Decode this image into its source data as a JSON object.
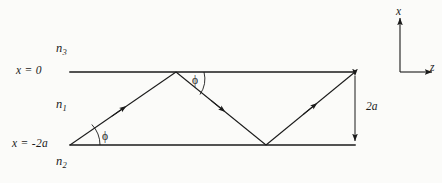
{
  "figure": {
    "background_color": "#fbfbf9",
    "ink_color": "#1a1a1a"
  },
  "boundaries": {
    "top": {
      "label_x": "x",
      "label_eq": "=",
      "label_value": "0",
      "label_full": "x = 0",
      "y_px": 72,
      "x_start_px": 70,
      "x_end_px": 355
    },
    "bottom": {
      "label_x": "x",
      "label_eq": "=",
      "label_value": "-2a",
      "label_full": "x = -2a",
      "y_px": 145,
      "x_start_px": 70,
      "x_end_px": 355
    }
  },
  "media": [
    {
      "name": "n",
      "subscript": "3",
      "region": "above-top-boundary",
      "x_px": 56,
      "y_px": 48
    },
    {
      "name": "n",
      "subscript": "1",
      "region": "core-between-boundaries",
      "x_px": 56,
      "y_px": 104
    },
    {
      "name": "n",
      "subscript": "2",
      "region": "below-bottom-boundary",
      "x_px": 56,
      "y_px": 160
    }
  ],
  "ray": {
    "vertices": [
      {
        "x": 70,
        "y": 145,
        "kind": "launch-point"
      },
      {
        "x": 176,
        "y": 72,
        "kind": "reflection-top"
      },
      {
        "x": 266,
        "y": 145,
        "kind": "reflection-bottom"
      },
      {
        "x": 355,
        "y": 72,
        "kind": "exit-point"
      }
    ],
    "direction_arrow_count": 3
  },
  "angles": [
    {
      "symbol": "ϕ",
      "name": "phi-bottom",
      "vertex_x": 70,
      "vertex_y": 145,
      "label_x": 102,
      "label_y": 131
    },
    {
      "symbol": "ϕ",
      "name": "phi-top",
      "vertex_x": 176,
      "vertex_y": 72,
      "label_x": 192,
      "label_y": 79
    }
  ],
  "dimension": {
    "label": "2a",
    "label_x": 377,
    "label_y": 104,
    "line_x": 355,
    "y_top": 72,
    "y_bottom": 145,
    "style": "double-headed-arrow"
  },
  "axes": {
    "origin_x": 400,
    "origin_y": 72,
    "vertical": {
      "label": "x",
      "direction": "up",
      "label_x": 396,
      "label_y": 10,
      "tip_y": 18
    },
    "horizontal": {
      "label": "z",
      "direction": "right",
      "label_x": 428,
      "label_y": 66,
      "tip_x": 432
    }
  }
}
